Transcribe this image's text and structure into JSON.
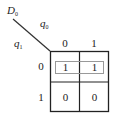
{
  "kmap": {
    "output_var": {
      "name": "D",
      "sub": "0"
    },
    "col_var": {
      "name": "q",
      "sub": "0"
    },
    "row_var": {
      "name": "q",
      "sub": "1"
    },
    "col_labels": [
      "0",
      "1"
    ],
    "row_labels": [
      "0",
      "1"
    ],
    "cells": [
      [
        "1",
        "1"
      ],
      [
        "0",
        "0"
      ]
    ],
    "groups": [
      {
        "row": 0,
        "cols": [
          0,
          1
        ]
      }
    ]
  }
}
